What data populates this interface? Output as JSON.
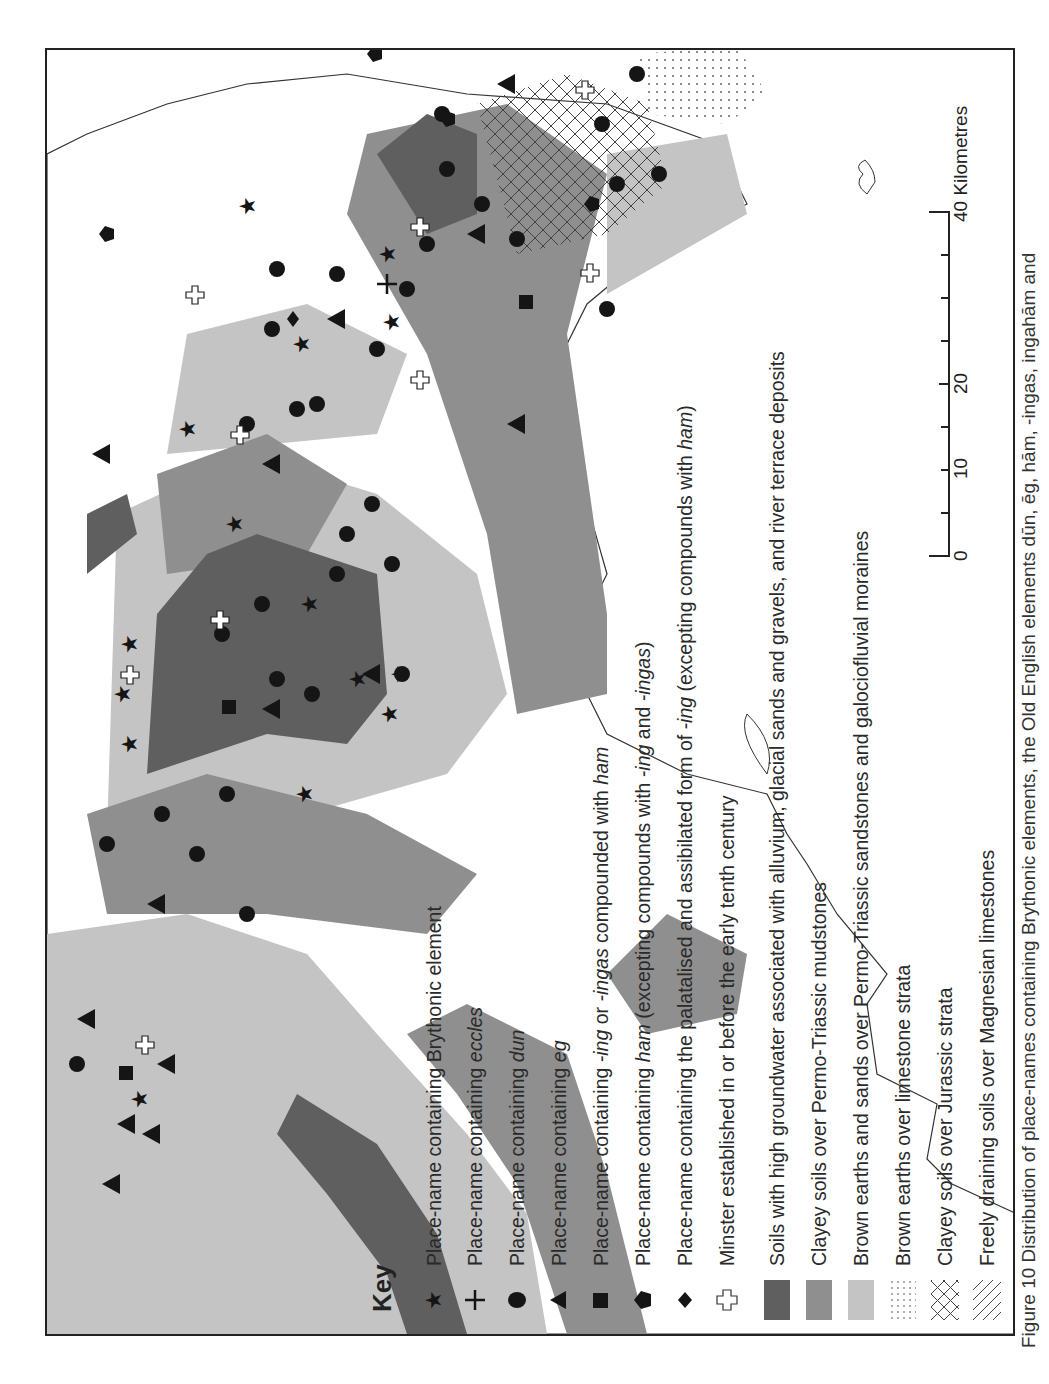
{
  "figure": {
    "caption": "Figure 10 Distribution of place-names containing Brythonic elements, the Old English elements dūn, ēg, hām, -ingas, ingahām and",
    "orientation": "rotated 90° counter-clockwise (landscape figure on portrait page)"
  },
  "key": {
    "title": "Key",
    "items": [
      {
        "symbol": "star-icon",
        "label": "Place-name containing Brythonic element",
        "italic": ""
      },
      {
        "symbol": "cross-icon",
        "label": "Place-name containing ",
        "italic": "eccles"
      },
      {
        "symbol": "circle-icon",
        "label": "Place-name containing ",
        "italic": "dun"
      },
      {
        "symbol": "triangle-icon",
        "label": "Place-name containing ",
        "italic": "eg"
      },
      {
        "symbol": "square-icon",
        "label": "Place-name containing -ing or -ingas compounded with ham"
      },
      {
        "symbol": "pentagon-icon",
        "label": "Place-name containing ham (excepting compounds with -ing and -ingas)"
      },
      {
        "symbol": "diamond-icon",
        "label": "Place-name containing the palatalised and assibilated form of -ing (excepting compounds with ham)"
      },
      {
        "symbol": "open-cross-icon",
        "label": "Minster established in or before the early tenth century"
      },
      {
        "symbol": "dark-grey-swatch",
        "label": "Soils with high groundwater associated with alluvium, glacial sands and gravels, and river terrace deposits",
        "color": "#5f5f5f"
      },
      {
        "symbol": "mid-grey-swatch",
        "label": "Clayey soils over Permo-Triassic mudstones",
        "color": "#8f8f8f"
      },
      {
        "symbol": "light-grey-swatch",
        "label": "Brown earths and sands over Permo-Triassic sandstones and galociofluvial moraines",
        "color": "#c4c4c4"
      },
      {
        "symbol": "dotted-swatch",
        "label": "Brown earths over limestone strata"
      },
      {
        "symbol": "crosshatch-swatch",
        "label": "Clayey soils over Jurassic strata"
      },
      {
        "symbol": "diagonal-hatch-swatch",
        "label": "Freely draining soils over Magnesian limestones"
      }
    ],
    "rich_labels": [
      [
        "Place-name containing Brythonic element"
      ],
      [
        "Place-name containing ",
        {
          "i": "eccles"
        }
      ],
      [
        "Place-name containing ",
        {
          "i": "dun"
        }
      ],
      [
        "Place-name containing ",
        {
          "i": "eg"
        }
      ],
      [
        "Place-name containing ",
        {
          "i": "-ing"
        },
        " or ",
        {
          "i": "-ingas"
        },
        " compounded with ",
        {
          "i": "ham"
        }
      ],
      [
        "Place-name containing ",
        {
          "i": "ham"
        },
        " (excepting compounds with ",
        {
          "i": "-ing"
        },
        " and ",
        {
          "i": "-ingas"
        },
        ")"
      ],
      [
        "Place-name containing the palatalised and assibilated form of ",
        {
          "i": "-ing"
        },
        " (excepting compounds with ",
        {
          "i": "ham"
        },
        ")"
      ],
      [
        "Minster established in or before the early tenth century"
      ],
      [
        "Soils with high groundwater associated with alluvium, glacial sands and gravels, and river terrace deposits"
      ],
      [
        "Clayey soils over Permo-Triassic mudstones"
      ],
      [
        "Brown earths and sands over Permo-Triassic sandstones and galociofluvial moraines"
      ],
      [
        "Brown earths over limestone strata"
      ],
      [
        "Clayey soils over Jurassic strata"
      ],
      [
        "Freely draining soils over Magnesian limestones"
      ]
    ]
  },
  "scale_bar": {
    "unit_label": "Kilometres",
    "ticks": [
      0,
      5,
      10,
      15,
      20,
      25,
      30,
      35,
      40
    ],
    "labels": [
      "0",
      "10",
      "20",
      "40 Kilometres"
    ],
    "label_values": [
      0,
      10,
      20,
      40
    ]
  },
  "colors": {
    "dark_grey": "#5f5f5f",
    "mid_grey": "#8f8f8f",
    "light_grey": "#c4c4c4",
    "frame": "#222222",
    "symbol": "#151515"
  }
}
